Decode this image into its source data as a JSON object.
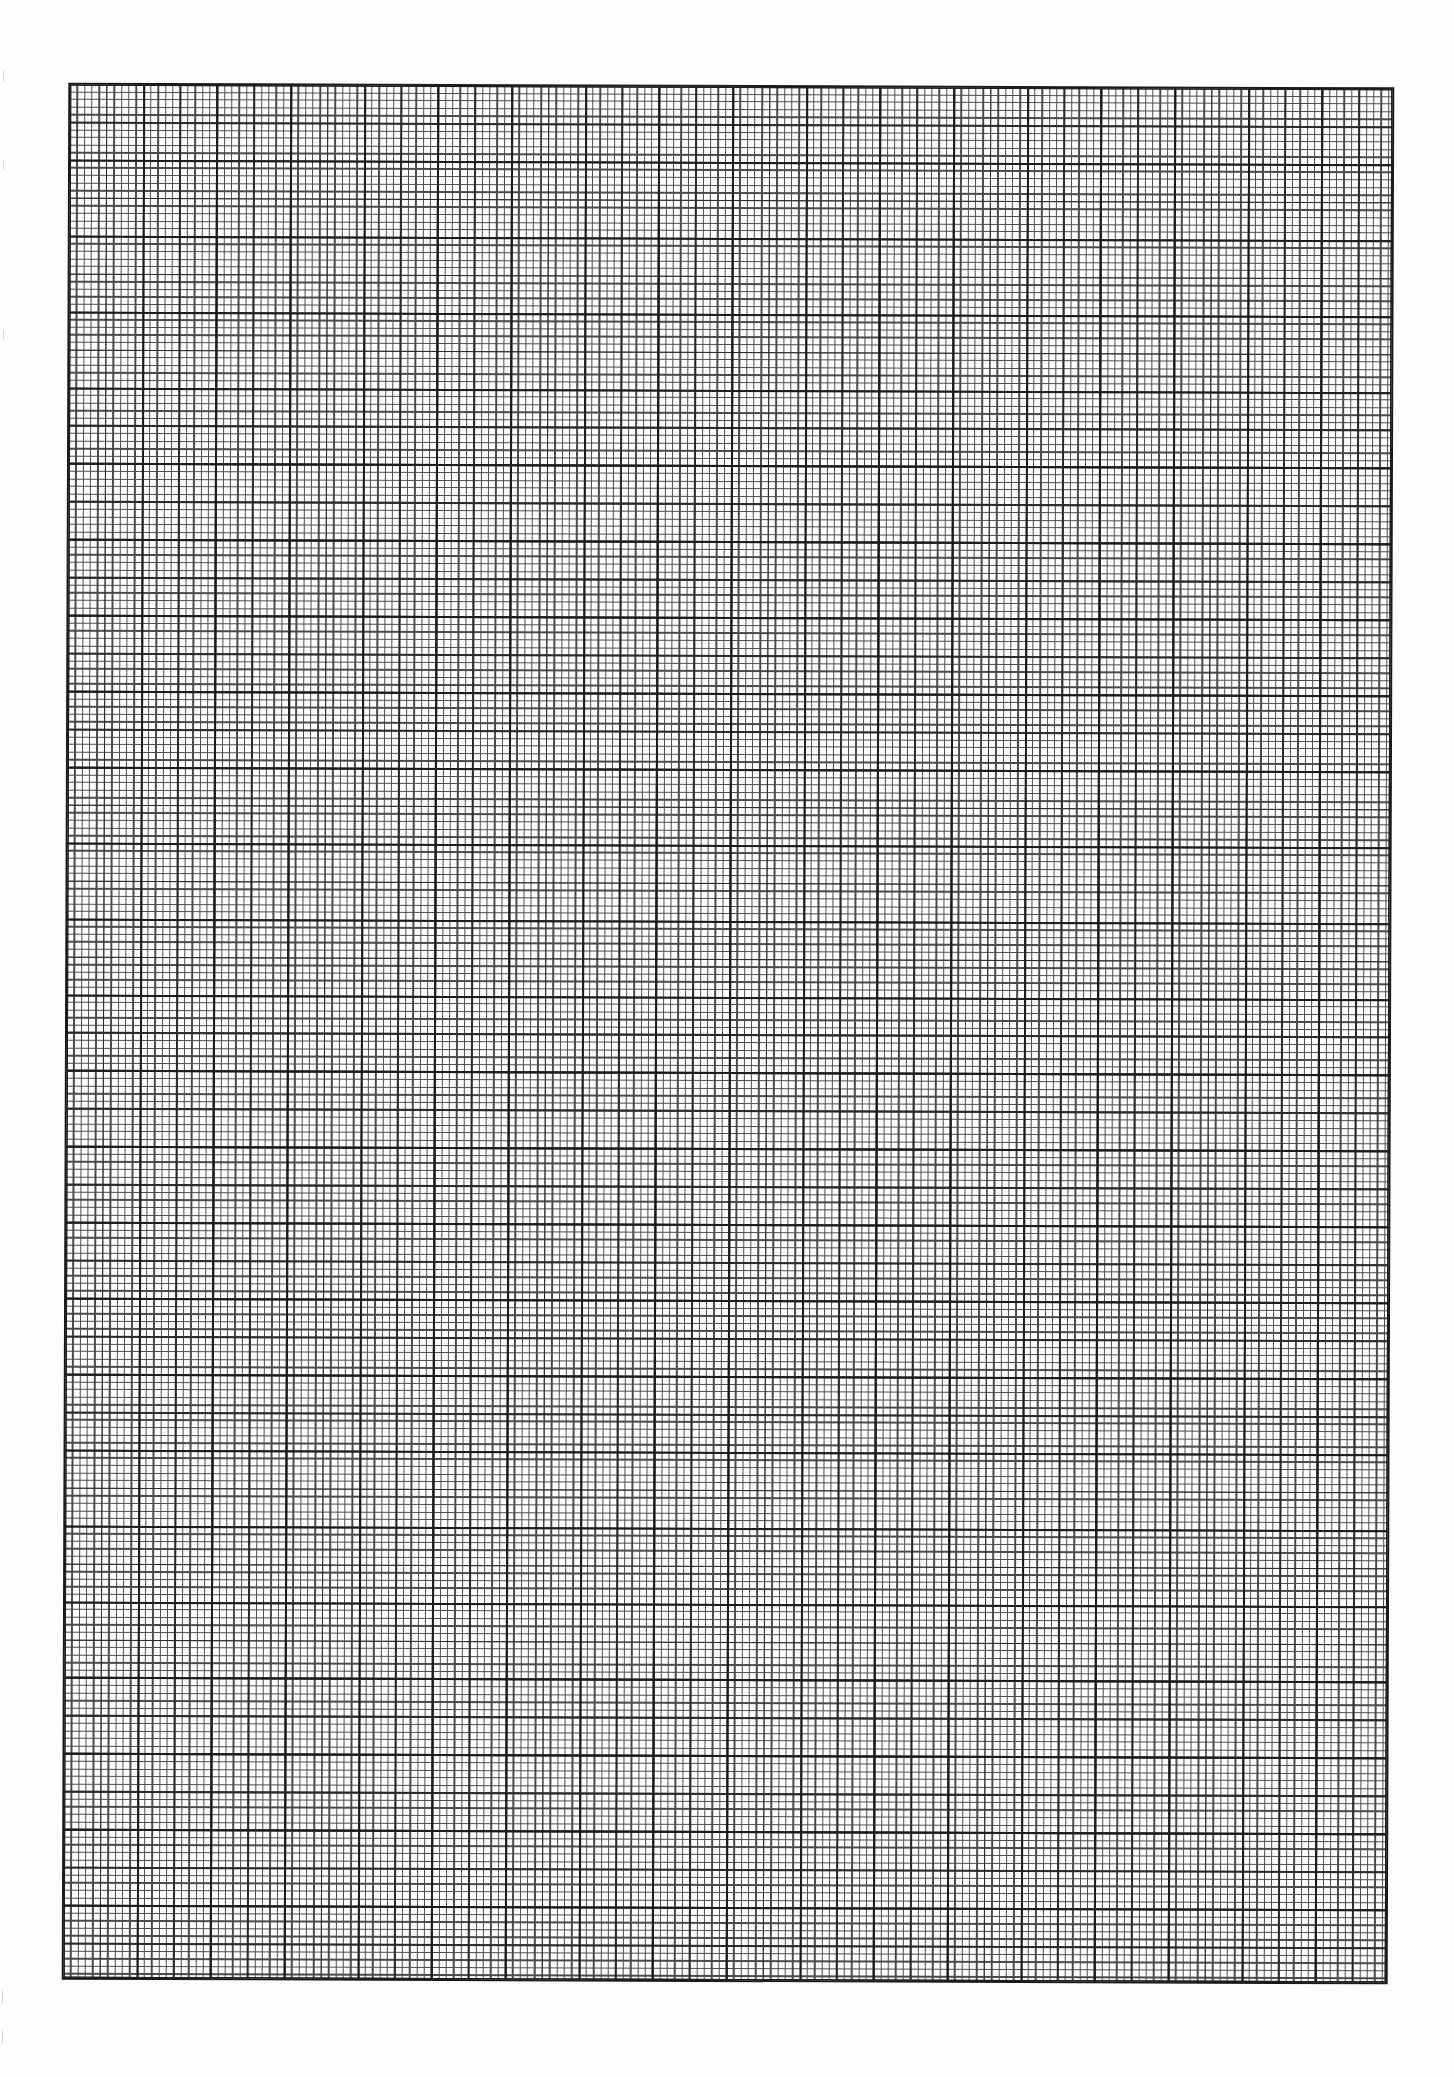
{
  "page": {
    "type": "graph-paper",
    "background_color": "#ffffff",
    "line_color": "#1c1c1c"
  },
  "grid": {
    "major_columns": 18,
    "major_rows": 25,
    "minor_divisions_per_major": 10,
    "medium_division_every": 5,
    "total_small_columns": 180,
    "total_small_rows": 250
  }
}
